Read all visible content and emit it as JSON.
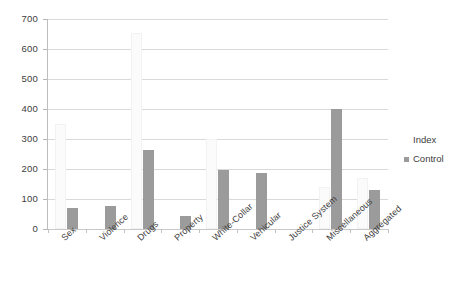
{
  "chart_data": {
    "type": "bar",
    "title": "",
    "subtitle": "",
    "xlabel": "",
    "ylabel": "",
    "ylim": [
      0,
      700
    ],
    "ytick_values": [
      0,
      100,
      200,
      300,
      400,
      500,
      600,
      700
    ],
    "ytick_labels": [
      "0",
      "100",
      "200",
      "300",
      "400",
      "500",
      "600",
      "700"
    ],
    "grid": true,
    "grid_axis": "y",
    "legend_position": "right",
    "legend_title": "Index",
    "categories": [
      "Sex",
      "Violence",
      "Drugs",
      "Property",
      "White-Collar",
      "Vehicular",
      "Justice System",
      "Miscellaneous",
      "Aggregated"
    ],
    "series": [
      {
        "name": "Index",
        "color": "#fbfbfb",
        "values": [
          350,
          0,
          655,
          0,
          300,
          0,
          0,
          140,
          170
        ]
      },
      {
        "name": "Control",
        "color": "#9b9b9b",
        "values": [
          70,
          77,
          265,
          45,
          197,
          188,
          0,
          400,
          130
        ]
      }
    ]
  },
  "legend": {
    "title": "Index",
    "entries": [
      {
        "label": "Control",
        "color": "#9b9b9b"
      }
    ]
  },
  "colors": {
    "background": "#ffffff",
    "gridline": "#d9d9d9",
    "axis": "#bdbdbd",
    "text": "#3d3d3d",
    "control_bar": "#9b9b9b",
    "index_bar": "#fbfbfb"
  }
}
